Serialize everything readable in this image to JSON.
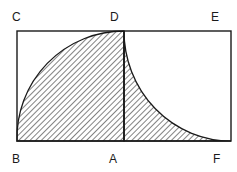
{
  "diagram": {
    "labels": {
      "C": "C",
      "D": "D",
      "E": "E",
      "B": "B",
      "A": "A",
      "F": "F"
    },
    "colors": {
      "stroke": "#1a1a1a",
      "background": "#ffffff"
    }
  }
}
